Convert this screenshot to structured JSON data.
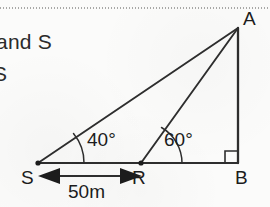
{
  "page": {
    "background_color": "#fbfbfa",
    "ink_color": "#231f20"
  },
  "margin_text": {
    "line_1": "and S",
    "line_2": "S"
  },
  "figure": {
    "type": "geometry-diagram",
    "stroke_color": "#2e2e2e",
    "vertices": [
      {
        "id": "A",
        "label": "A",
        "x": 238,
        "y": 28
      },
      {
        "id": "B",
        "label": "B",
        "x": 238,
        "y": 163
      },
      {
        "id": "S",
        "label": "S",
        "x": 38,
        "y": 163
      },
      {
        "id": "R",
        "label": "R",
        "x": 141,
        "y": 163
      }
    ],
    "segments": [
      {
        "name": "base-SB",
        "from": "S",
        "to": "B"
      },
      {
        "name": "vertical-AB",
        "from": "A",
        "to": "B"
      },
      {
        "name": "hypotenuse-SA",
        "from": "S",
        "to": "A"
      },
      {
        "name": "line-RA",
        "from": "R",
        "to": "A"
      }
    ],
    "angles": [
      {
        "name": "angle-at-S",
        "vertex": "S",
        "label": "40°",
        "value": 40
      },
      {
        "name": "angle-at-R",
        "vertex": "R",
        "label": "60°",
        "value": 60
      }
    ],
    "right_angle": {
      "name": "right-angle-at-B",
      "vertex": "B",
      "value": 90
    },
    "dimension": {
      "name": "distance-SR",
      "label": "50m",
      "from": "S",
      "to": "R",
      "style": "double-headed-arrow"
    }
  }
}
